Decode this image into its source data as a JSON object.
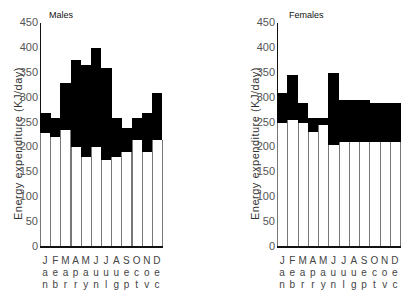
{
  "chart_data": [
    {
      "type": "bar",
      "title": "Males",
      "xlabel": "",
      "ylabel": "Energy expenditure (KJ/day)",
      "ylim": [
        0,
        450
      ],
      "yticks": [
        0,
        50,
        100,
        150,
        200,
        250,
        300,
        350,
        400,
        450
      ],
      "categories": [
        "Jan",
        "Feb",
        "Mar",
        "Apr",
        "May",
        "Jun",
        "Jul",
        "Aug",
        "Sep",
        "Oct",
        "Nov",
        "Dec"
      ],
      "category_labels": [
        [
          "J",
          "a",
          "n"
        ],
        [
          "F",
          "e",
          "b"
        ],
        [
          "M",
          "a",
          "r"
        ],
        [
          "A",
          "p",
          "r"
        ],
        [
          "M",
          "a",
          "y"
        ],
        [
          "J",
          "u",
          "n"
        ],
        [
          "J",
          "u",
          "l"
        ],
        [
          "A",
          "u",
          "g"
        ],
        [
          "S",
          "e",
          "p"
        ],
        [
          "O",
          "c",
          "t"
        ],
        [
          "N",
          "o",
          "v"
        ],
        [
          "D",
          "e",
          "c"
        ]
      ],
      "series": [
        {
          "name": "lower (white)",
          "color": "#ffffff",
          "values": [
            230,
            220,
            235,
            200,
            180,
            200,
            175,
            180,
            190,
            215,
            190,
            215
          ]
        },
        {
          "name": "total (black top)",
          "color": "#000000",
          "values": [
            270,
            260,
            330,
            375,
            365,
            400,
            360,
            260,
            240,
            260,
            270,
            310
          ]
        }
      ]
    },
    {
      "type": "bar",
      "title": "Females",
      "xlabel": "",
      "ylabel": "Energy expenditure (KJ/day)",
      "ylim": [
        0,
        450
      ],
      "yticks": [
        0,
        50,
        100,
        150,
        200,
        250,
        300,
        350,
        400,
        450
      ],
      "categories": [
        "Jan",
        "Feb",
        "Mar",
        "Apr",
        "May",
        "Jun",
        "Jul",
        "Aug",
        "Sep",
        "Oct",
        "Nov",
        "Dec"
      ],
      "category_labels": [
        [
          "J",
          "a",
          "n"
        ],
        [
          "F",
          "e",
          "b"
        ],
        [
          "M",
          "a",
          "r"
        ],
        [
          "A",
          "p",
          "r"
        ],
        [
          "M",
          "a",
          "y"
        ],
        [
          "J",
          "u",
          "n"
        ],
        [
          "J",
          "u",
          "l"
        ],
        [
          "A",
          "u",
          "g"
        ],
        [
          "S",
          "e",
          "p"
        ],
        [
          "O",
          "c",
          "t"
        ],
        [
          "N",
          "o",
          "v"
        ],
        [
          "D",
          "e",
          "c"
        ]
      ],
      "series": [
        {
          "name": "lower (white)",
          "color": "#ffffff",
          "values": [
            250,
            255,
            250,
            230,
            245,
            205,
            210,
            210,
            210,
            210,
            210,
            210
          ]
        },
        {
          "name": "total (black top)",
          "color": "#000000",
          "values": [
            310,
            345,
            290,
            260,
            260,
            350,
            295,
            295,
            295,
            290,
            290,
            290
          ]
        }
      ]
    }
  ]
}
